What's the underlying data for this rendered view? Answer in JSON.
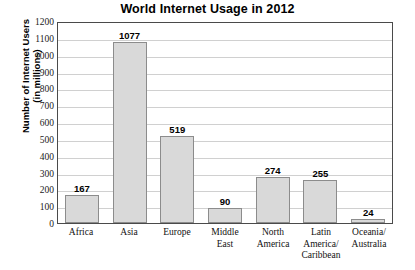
{
  "chart_data": {
    "type": "bar",
    "title": "World Internet Usage in 2012",
    "xlabel": "",
    "ylabel": "Number of Internet Users (in millions)",
    "ylabel_lines": [
      "Number of Internet Users",
      "(in millions)"
    ],
    "categories": [
      "Africa",
      "Asia",
      "Europe",
      "Middle East",
      "North America",
      "Latin America/Caribbean",
      "Oceania/Australia"
    ],
    "category_lines": [
      [
        "Africa"
      ],
      [
        "Asia"
      ],
      [
        "Europe"
      ],
      [
        "Middle",
        "East"
      ],
      [
        "North",
        "America"
      ],
      [
        "Latin",
        "America/",
        "Caribbean"
      ],
      [
        "Oceania/",
        "Australia"
      ]
    ],
    "values": [
      167,
      1077,
      519,
      90,
      274,
      255,
      24
    ],
    "value_labels": [
      "167",
      "1077",
      "519",
      "90",
      "274",
      "255",
      "24"
    ],
    "ylim": [
      0,
      1200
    ],
    "ytick_step": 100,
    "yticks": [
      1200,
      1100,
      1000,
      900,
      800,
      700,
      600,
      500,
      400,
      300,
      200,
      100,
      0
    ],
    "ytick_labels": [
      "1200",
      "1100",
      "1000",
      "900",
      "800",
      "700",
      "600",
      "500",
      "400",
      "300",
      "200",
      "100",
      "0"
    ],
    "grid": true,
    "grid_axis": "y",
    "legend": false,
    "colors": {
      "bar_fill": "#d9d9d9",
      "bar_border": "#8c8c8c",
      "plot_border": "#4a4a4a",
      "gridline": "#d0d0d0",
      "background": "#ffffff",
      "text": "#000000"
    }
  }
}
